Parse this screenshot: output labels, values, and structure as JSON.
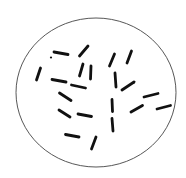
{
  "diagram": {
    "title": "",
    "colors": {
      "background": "#ffffff",
      "outline": "#444444",
      "cells": "#111111"
    },
    "field": {
      "cx": 96,
      "cy": 92.5,
      "rx": 80,
      "ry": 74.5
    },
    "rods": [
      {
        "x1": 54,
        "y1": 52,
        "x2": 68,
        "y2": 54.5
      },
      {
        "x1": 79.5,
        "y1": 56,
        "x2": 88,
        "y2": 46
      },
      {
        "x1": 36.5,
        "y1": 80,
        "x2": 40.5,
        "y2": 68
      },
      {
        "x1": 79.5,
        "y1": 76,
        "x2": 83,
        "y2": 64
      },
      {
        "x1": 90.5,
        "y1": 79,
        "x2": 91,
        "y2": 66
      },
      {
        "x1": 109.5,
        "y1": 66,
        "x2": 114.5,
        "y2": 54
      },
      {
        "x1": 127,
        "y1": 63,
        "x2": 131.5,
        "y2": 51
      },
      {
        "x1": 52,
        "y1": 79.5,
        "x2": 66,
        "y2": 82
      },
      {
        "x1": 71.5,
        "y1": 85,
        "x2": 85.5,
        "y2": 88
      },
      {
        "x1": 115,
        "y1": 73,
        "x2": 116,
        "y2": 87
      },
      {
        "x1": 122,
        "y1": 90,
        "x2": 134,
        "y2": 82
      },
      {
        "x1": 59.5,
        "y1": 93,
        "x2": 71,
        "y2": 100.5
      },
      {
        "x1": 144,
        "y1": 97,
        "x2": 158,
        "y2": 93.5
      },
      {
        "x1": 112,
        "y1": 99.5,
        "x2": 112.5,
        "y2": 111.5
      },
      {
        "x1": 131,
        "y1": 112,
        "x2": 142.5,
        "y2": 105.5
      },
      {
        "x1": 157,
        "y1": 109,
        "x2": 170.5,
        "y2": 105.5
      },
      {
        "x1": 59,
        "y1": 110,
        "x2": 70,
        "y2": 117
      },
      {
        "x1": 78,
        "y1": 114,
        "x2": 91.5,
        "y2": 116.5
      },
      {
        "x1": 112,
        "y1": 118.5,
        "x2": 113,
        "y2": 131
      },
      {
        "x1": 65.5,
        "y1": 134.5,
        "x2": 79,
        "y2": 137
      },
      {
        "x1": 91.5,
        "y1": 149,
        "x2": 96,
        "y2": 137
      }
    ],
    "specks": [
      {
        "cx": 51,
        "cy": 57.5,
        "r": 1.1
      }
    ],
    "rod_width": 2.8
  }
}
